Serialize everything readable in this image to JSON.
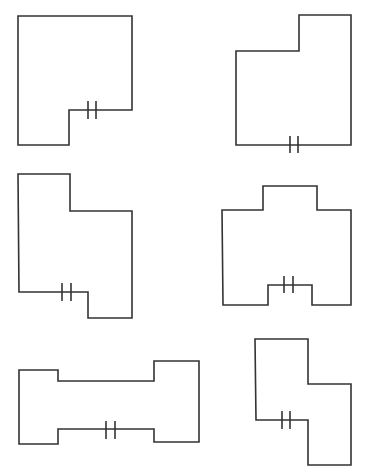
{
  "canvas": {
    "width": 367,
    "height": 472,
    "background": "#ffffff",
    "stroke": "#333333"
  },
  "shapes": [
    {
      "id": "shape-1",
      "points": [
        [
          18,
          16
        ],
        [
          132,
          16
        ],
        [
          132,
          110
        ],
        [
          69,
          110
        ],
        [
          69,
          145
        ],
        [
          18,
          145
        ]
      ],
      "ticks": [
        [
          88,
          101,
          88,
          119
        ],
        [
          96,
          101,
          96,
          119
        ]
      ]
    },
    {
      "id": "shape-2",
      "points": [
        [
          299,
          15
        ],
        [
          351,
          15
        ],
        [
          351,
          145
        ],
        [
          236,
          145
        ],
        [
          236,
          51
        ],
        [
          299,
          51
        ]
      ],
      "ticks": [
        [
          290,
          136,
          290,
          153
        ],
        [
          298,
          136,
          298,
          153
        ]
      ]
    },
    {
      "id": "shape-3",
      "points": [
        [
          18,
          174
        ],
        [
          70,
          174
        ],
        [
          70,
          211
        ],
        [
          132,
          211
        ],
        [
          132,
          318
        ],
        [
          88,
          318
        ],
        [
          88,
          292
        ],
        [
          19,
          292
        ]
      ],
      "ticks": [
        [
          62,
          283,
          62,
          301
        ],
        [
          71,
          283,
          71,
          301
        ]
      ]
    },
    {
      "id": "shape-4",
      "points": [
        [
          222,
          210
        ],
        [
          263,
          210
        ],
        [
          263,
          186
        ],
        [
          317,
          186
        ],
        [
          317,
          210
        ],
        [
          351,
          210
        ],
        [
          351,
          305
        ],
        [
          312,
          305
        ],
        [
          312,
          285
        ],
        [
          268,
          285
        ],
        [
          268,
          305
        ],
        [
          223,
          305
        ]
      ],
      "ticks": [
        [
          284,
          276,
          284,
          293
        ],
        [
          293,
          276,
          293,
          293
        ]
      ]
    },
    {
      "id": "shape-5",
      "points": [
        [
          19,
          370
        ],
        [
          58,
          370
        ],
        [
          58,
          381
        ],
        [
          154,
          381
        ],
        [
          154,
          361
        ],
        [
          199,
          361
        ],
        [
          199,
          442
        ],
        [
          154,
          442
        ],
        [
          154,
          429
        ],
        [
          58,
          429
        ],
        [
          58,
          444
        ],
        [
          19,
          444
        ]
      ],
      "ticks": [
        [
          106,
          421,
          106,
          439
        ],
        [
          115,
          421,
          115,
          439
        ]
      ]
    },
    {
      "id": "shape-6",
      "points": [
        [
          255,
          339
        ],
        [
          308,
          339
        ],
        [
          308,
          384
        ],
        [
          351,
          384
        ],
        [
          351,
          465
        ],
        [
          308,
          465
        ],
        [
          308,
          420
        ],
        [
          256,
          420
        ]
      ],
      "ticks": [
        [
          282,
          411,
          282,
          429
        ],
        [
          290,
          411,
          290,
          429
        ]
      ]
    }
  ]
}
